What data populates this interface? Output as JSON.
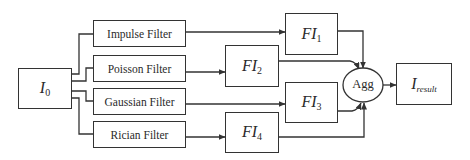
{
  "diagram": {
    "input": {
      "symbol": "I",
      "subscript": "0"
    },
    "filters": [
      {
        "label": "Impulse Filter"
      },
      {
        "label": "Poisson Filter"
      },
      {
        "label": "Gaussian Filter"
      },
      {
        "label": "Rician Filter"
      }
    ],
    "filtered_images": [
      {
        "symbol": "FI",
        "subscript": "1"
      },
      {
        "symbol": "FI",
        "subscript": "2"
      },
      {
        "symbol": "FI",
        "subscript": "3"
      },
      {
        "symbol": "FI",
        "subscript": "4"
      }
    ],
    "aggregator": {
      "label": "Agg"
    },
    "output": {
      "symbol": "I",
      "subscript": "result"
    },
    "colors": {
      "stroke": "#333333",
      "text": "#2a2a2a",
      "background": "#ffffff"
    }
  }
}
